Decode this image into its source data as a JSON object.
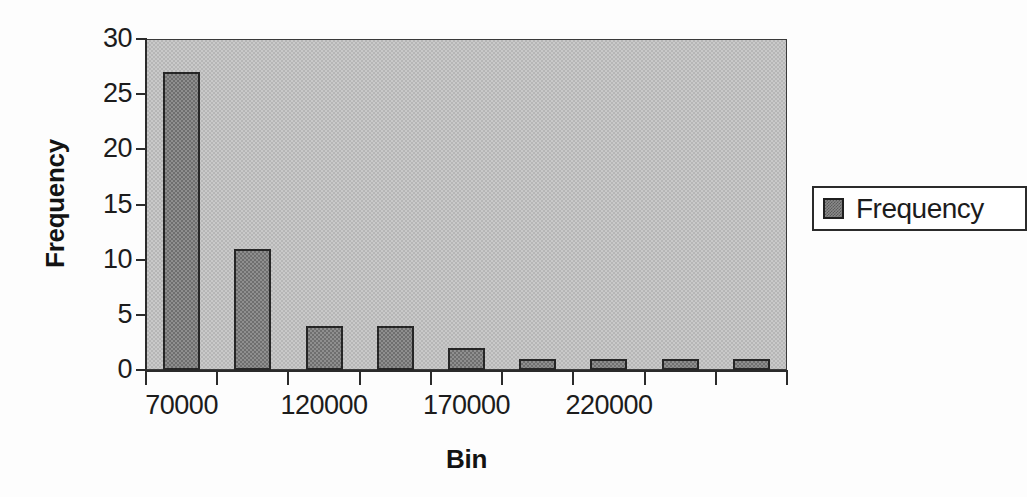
{
  "chart_data": {
    "type": "bar",
    "title": "",
    "xlabel": "Bin",
    "ylabel": "Frequency",
    "ylim": [
      0,
      30
    ],
    "yticks": [
      0,
      5,
      10,
      15,
      20,
      25,
      30
    ],
    "ytick_labels": [
      "0",
      "5",
      "10",
      "15",
      "20",
      "25",
      "30"
    ],
    "categories": [
      "70000",
      "95000",
      "120000",
      "145000",
      "170000",
      "195000",
      "220000",
      "245000",
      "270000"
    ],
    "xtick_labels": [
      "70000",
      "120000",
      "170000",
      "220000"
    ],
    "values": [
      27,
      11,
      4,
      4,
      2,
      1,
      1,
      1,
      1
    ],
    "series": [
      {
        "name": "Frequency",
        "values": [
          27,
          11,
          4,
          4,
          2,
          1,
          1,
          1,
          1
        ]
      }
    ],
    "grid": false,
    "legend_position": "right",
    "legend_entries": [
      "Frequency"
    ],
    "colors": {
      "bar_fill": "#8f8f8f",
      "bar_border": "#262626",
      "plot_background": "#c9c9c9",
      "axis": "#2b2b2b",
      "text": "#1c1c1c",
      "page_background": "#ffffff"
    }
  },
  "legend": {
    "label": "Frequency"
  },
  "axes": {
    "x_title": "Bin",
    "y_title": "Frequency"
  }
}
